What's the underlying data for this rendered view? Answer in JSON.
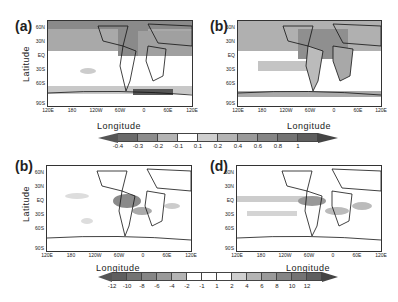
{
  "chart_data": [
    {
      "type": "heatmap",
      "panel": "(a)",
      "title": "(a)",
      "xlabel": "Longitude",
      "ylabel": "Latitude",
      "x_ticks": [
        "120E",
        "180",
        "120W",
        "60W",
        "0",
        "60E",
        "120E"
      ],
      "y_ticks": [
        "60N",
        "30N",
        "EQ",
        "30S",
        "60S",
        "90S"
      ],
      "colorbar_ref": "colorbar_top",
      "description": "Global map, negative anomalies shaded gray over Northern Hemisphere mid-high latitudes, North Atlantic and Southern Ocean"
    },
    {
      "type": "heatmap",
      "panel": "(b)",
      "title": "(b)",
      "xlabel": "Longitude",
      "ylabel": "",
      "x_ticks": [
        "120E",
        "180",
        "120W",
        "60W",
        "0",
        "60E",
        "120E"
      ],
      "y_ticks": [
        "60N",
        "30N",
        "EQ",
        "30S",
        "60S",
        "90S"
      ],
      "colorbar_ref": "colorbar_top",
      "description": "Global map, positive anomalies shaded over Northern Hemisphere continents, North Atlantic and tropical Pacific"
    },
    {
      "type": "heatmap",
      "panel": "(b)",
      "title": "(b)",
      "xlabel": "Longitude",
      "ylabel": "Latitude",
      "x_ticks": [
        "120E",
        "180",
        "120W",
        "60W",
        "0",
        "60E",
        "120E"
      ],
      "y_ticks": [
        "60N",
        "30N",
        "EQ",
        "30S",
        "60S",
        "90S"
      ],
      "colorbar_ref": "colorbar_bottom",
      "description": "Global map, negative anomalies in tropical Atlantic and Caribbean"
    },
    {
      "type": "heatmap",
      "panel": "(d)",
      "title": "(d)",
      "xlabel": "Longitude",
      "ylabel": "",
      "x_ticks": [
        "120E",
        "180",
        "120W",
        "60W",
        "0",
        "60E",
        "120E"
      ],
      "y_ticks": [
        "60N",
        "30N",
        "EQ",
        "30S",
        "60S",
        "90S"
      ],
      "colorbar_ref": "colorbar_bottom",
      "description": "Global map, positive anomalies in tropical bands of Pacific, Atlantic and Indian Oceans"
    }
  ],
  "panels": [
    {
      "label": "(a)",
      "xlabel": "Longitude",
      "ylabel": "Latitude"
    },
    {
      "label": "(b)",
      "xlabel": "Longitude",
      "ylabel": ""
    },
    {
      "label": "(b)",
      "xlabel": "Longitude",
      "ylabel": "Latitude"
    },
    {
      "label": "(d)",
      "xlabel": "Longitude",
      "ylabel": ""
    }
  ],
  "x_ticks": [
    "120E",
    "180",
    "120W",
    "60W",
    "0",
    "60E",
    "120E"
  ],
  "y_ticks": [
    "60N",
    "30N",
    "EQ",
    "30S",
    "60S",
    "90S"
  ],
  "colorbar_top": {
    "labels": [
      "-0.4",
      "-0.3",
      "-0.2",
      "-0.1",
      "0.1",
      "0.2",
      "0.4",
      "0.6",
      "0.8",
      "1"
    ],
    "colors": [
      "#6a6a6a",
      "#8c8c8c",
      "#b4b4b4",
      "#ffffff",
      "#cfcfcf",
      "#b4b4b4",
      "#9a9a9a",
      "#858585",
      "#737373",
      "#5e5e5e"
    ]
  },
  "colorbar_bottom": {
    "labels": [
      "-12",
      "-10",
      "-8",
      "-6",
      "-4",
      "-2",
      "-1",
      "1",
      "2",
      "4",
      "6",
      "8",
      "10",
      "12"
    ],
    "colors": [
      "#5e5e5e",
      "#737373",
      "#858585",
      "#9a9a9a",
      "#b4b4b4",
      "#ffffff",
      "#ffffff",
      "#ffffff",
      "#cfcfcf",
      "#b4b4b4",
      "#9a9a9a",
      "#858585",
      "#737373",
      "#5e5e5e"
    ]
  }
}
